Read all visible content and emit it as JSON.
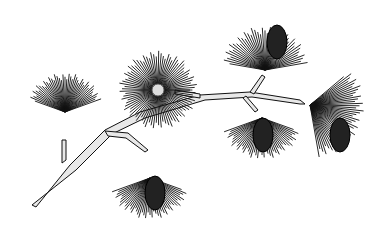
{
  "image": {
    "subject": "pine branch illustration",
    "style": "black and white engraving",
    "colors": {
      "background": "#ffffff",
      "ink": "#111111",
      "branch_fill": "#e8e8e8"
    },
    "tufts": [
      {
        "name": "left-tuft",
        "cx": 65,
        "cy": 112,
        "r": 40,
        "start": 200,
        "end": 340,
        "cone": false
      },
      {
        "name": "center-burst",
        "cx": 158,
        "cy": 90,
        "r": 40,
        "start": 0,
        "end": 360,
        "cone": false
      },
      {
        "name": "top-right-tuft",
        "cx": 265,
        "cy": 70,
        "r": 45,
        "start": 190,
        "end": 350,
        "cone": true,
        "cone_x": 277,
        "cone_y": 42
      },
      {
        "name": "lower-left-tuft",
        "cx": 150,
        "cy": 178,
        "r": 42,
        "start": 20,
        "end": 160,
        "cone": true,
        "cone_x": 155,
        "cone_y": 193
      },
      {
        "name": "lower-mid-tuft",
        "cx": 262,
        "cy": 118,
        "r": 42,
        "start": 20,
        "end": 160,
        "cone": true,
        "cone_x": 263,
        "cone_y": 135
      },
      {
        "name": "right-tuft",
        "cx": 310,
        "cy": 105,
        "r": 55,
        "start": -40,
        "end": 80,
        "cone": true,
        "cone_x": 340,
        "cone_y": 135
      }
    ]
  }
}
